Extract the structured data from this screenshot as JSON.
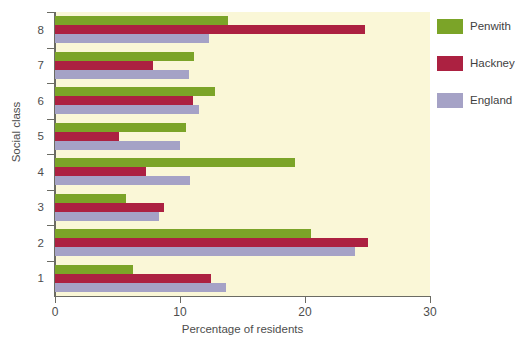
{
  "chart_data": {
    "type": "bar",
    "orientation": "horizontal",
    "title": "",
    "xlabel": "Percentage of residents",
    "ylabel": "Social class",
    "xlim": [
      0,
      30
    ],
    "xticks": [
      0,
      10,
      20,
      30
    ],
    "xtick_labels": [
      "0",
      "10",
      "20",
      "30"
    ],
    "categories": [
      "1",
      "2",
      "3",
      "4",
      "5",
      "6",
      "7",
      "8"
    ],
    "category_order": "bottom-to-top",
    "grid": false,
    "legend_position": "right",
    "plot_background": "#faf7d7",
    "series": [
      {
        "name": "Penwith",
        "color": "#7ba428",
        "values": [
          6.2,
          20.5,
          5.7,
          19.2,
          10.5,
          12.8,
          11.1,
          13.8
        ]
      },
      {
        "name": "Hackney",
        "color": "#ac2141",
        "values": [
          12.5,
          25.0,
          8.7,
          7.3,
          5.1,
          11.0,
          7.8,
          24.8
        ]
      },
      {
        "name": "England",
        "color": "#a5a2c6",
        "values": [
          13.7,
          24.0,
          8.3,
          10.8,
          10.0,
          11.5,
          10.7,
          12.3
        ]
      }
    ]
  },
  "legend": {
    "items": [
      {
        "label": "Penwith",
        "color": "#7ba428",
        "key": "penwith"
      },
      {
        "label": "Hackney",
        "color": "#ac2141",
        "key": "hackney"
      },
      {
        "label": "England",
        "color": "#a5a2c6",
        "key": "england"
      }
    ]
  }
}
